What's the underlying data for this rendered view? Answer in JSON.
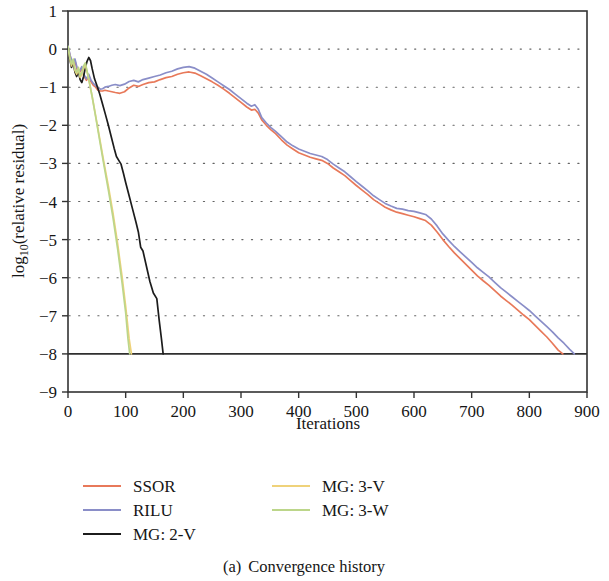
{
  "figure": {
    "caption_prefix": "(a)",
    "caption_text": "Convergence history"
  },
  "chart_data": {
    "type": "line",
    "title": "",
    "subtitle": "",
    "xlabel": "Iterations",
    "ylabel": "log10(relative residual)",
    "ylabel_base": "log",
    "ylabel_sub": "10",
    "ylabel_rest": "(relative residual)",
    "xlim": [
      0,
      900
    ],
    "ylim": [
      -9,
      1
    ],
    "xticks": [
      0,
      100,
      200,
      300,
      400,
      500,
      600,
      700,
      800,
      900
    ],
    "yticks": [
      1,
      0,
      -1,
      -2,
      -3,
      -4,
      -5,
      -6,
      -7,
      -8,
      -9
    ],
    "xticklabels": [
      "0",
      "100",
      "200",
      "300",
      "400",
      "500",
      "600",
      "700",
      "800",
      "900"
    ],
    "yticklabels": [
      "1",
      "0",
      "−1",
      "−2",
      "−3",
      "−4",
      "−5",
      "−6",
      "−7",
      "−8",
      "−9"
    ],
    "grid": "horizontal-dotted",
    "legend_position": "below-axes-two-columns",
    "tolerance": -8,
    "annotations": [],
    "series": [
      {
        "name": "SSOR",
        "color": "#e8795a",
        "x": [
          0,
          4,
          8,
          12,
          16,
          20,
          24,
          28,
          32,
          36,
          40,
          44,
          48,
          52,
          56,
          60,
          64,
          70,
          76,
          82,
          90,
          98,
          106,
          114,
          122,
          130,
          140,
          150,
          160,
          170,
          180,
          190,
          200,
          210,
          220,
          230,
          240,
          250,
          260,
          270,
          280,
          290,
          300,
          310,
          318,
          324,
          330,
          336,
          344,
          352,
          360,
          370,
          380,
          390,
          400,
          410,
          420,
          430,
          440,
          450,
          460,
          470,
          480,
          490,
          500,
          510,
          520,
          530,
          540,
          550,
          560,
          570,
          580,
          590,
          600,
          610,
          620,
          630,
          640,
          650,
          660,
          670,
          680,
          690,
          700,
          710,
          720,
          730,
          740,
          750,
          760,
          770,
          780,
          790,
          800,
          810,
          820,
          830,
          840,
          850,
          858
        ],
        "y": [
          0.05,
          -0.2,
          -0.42,
          -0.3,
          -0.55,
          -0.62,
          -0.5,
          -0.72,
          -0.82,
          -0.7,
          -0.86,
          -0.95,
          -1.0,
          -1.08,
          -1.1,
          -1.1,
          -1.08,
          -1.1,
          -1.12,
          -1.14,
          -1.16,
          -1.12,
          -1.02,
          -0.95,
          -0.98,
          -0.93,
          -0.88,
          -0.86,
          -0.8,
          -0.75,
          -0.72,
          -0.66,
          -0.62,
          -0.6,
          -0.63,
          -0.7,
          -0.78,
          -0.86,
          -0.95,
          -1.05,
          -1.16,
          -1.28,
          -1.4,
          -1.52,
          -1.6,
          -1.58,
          -1.68,
          -1.86,
          -2.0,
          -2.12,
          -2.22,
          -2.38,
          -2.52,
          -2.62,
          -2.72,
          -2.78,
          -2.84,
          -2.88,
          -2.92,
          -3.0,
          -3.12,
          -3.22,
          -3.32,
          -3.45,
          -3.58,
          -3.7,
          -3.82,
          -3.95,
          -4.05,
          -4.15,
          -4.22,
          -4.28,
          -4.32,
          -4.36,
          -4.4,
          -4.45,
          -4.5,
          -4.62,
          -4.8,
          -5.0,
          -5.18,
          -5.35,
          -5.5,
          -5.65,
          -5.8,
          -5.95,
          -6.08,
          -6.2,
          -6.34,
          -6.48,
          -6.6,
          -6.72,
          -6.85,
          -6.98,
          -7.1,
          -7.25,
          -7.4,
          -7.55,
          -7.72,
          -7.9,
          -8.0
        ]
      },
      {
        "name": "RILU",
        "color": "#8a8ec8",
        "x": [
          0,
          4,
          8,
          12,
          16,
          20,
          24,
          28,
          32,
          36,
          40,
          44,
          48,
          52,
          56,
          60,
          64,
          70,
          76,
          82,
          90,
          98,
          106,
          114,
          122,
          130,
          140,
          150,
          160,
          170,
          180,
          190,
          200,
          210,
          220,
          230,
          240,
          250,
          260,
          270,
          280,
          290,
          300,
          310,
          318,
          324,
          330,
          336,
          344,
          352,
          360,
          370,
          380,
          390,
          400,
          410,
          420,
          430,
          440,
          450,
          460,
          470,
          480,
          490,
          500,
          510,
          520,
          530,
          540,
          550,
          560,
          570,
          580,
          590,
          600,
          610,
          620,
          630,
          640,
          650,
          660,
          670,
          680,
          690,
          700,
          710,
          720,
          730,
          740,
          750,
          760,
          770,
          780,
          790,
          800,
          810,
          820,
          830,
          840,
          850,
          860,
          870,
          878
        ],
        "y": [
          0.08,
          -0.18,
          -0.38,
          -0.26,
          -0.5,
          -0.58,
          -0.46,
          -0.68,
          -0.78,
          -0.66,
          -0.82,
          -0.9,
          -0.96,
          -1.02,
          -1.05,
          -1.04,
          -1.0,
          -0.98,
          -0.95,
          -0.93,
          -0.96,
          -0.92,
          -0.85,
          -0.82,
          -0.86,
          -0.8,
          -0.76,
          -0.72,
          -0.68,
          -0.62,
          -0.58,
          -0.52,
          -0.48,
          -0.46,
          -0.5,
          -0.58,
          -0.66,
          -0.76,
          -0.86,
          -0.96,
          -1.06,
          -1.18,
          -1.3,
          -1.42,
          -1.5,
          -1.46,
          -1.58,
          -1.8,
          -1.94,
          -2.06,
          -2.16,
          -2.3,
          -2.44,
          -2.54,
          -2.62,
          -2.68,
          -2.74,
          -2.78,
          -2.82,
          -2.9,
          -3.02,
          -3.12,
          -3.22,
          -3.35,
          -3.48,
          -3.6,
          -3.72,
          -3.85,
          -3.95,
          -4.05,
          -4.12,
          -4.18,
          -4.2,
          -4.24,
          -4.26,
          -4.3,
          -4.34,
          -4.46,
          -4.64,
          -4.85,
          -5.02,
          -5.18,
          -5.32,
          -5.46,
          -5.6,
          -5.74,
          -5.86,
          -5.98,
          -6.12,
          -6.26,
          -6.38,
          -6.5,
          -6.62,
          -6.74,
          -6.86,
          -7.0,
          -7.14,
          -7.28,
          -7.42,
          -7.58,
          -7.72,
          -7.88,
          -8.0
        ]
      },
      {
        "name": "MG: 2-V",
        "color": "#1c1c1c",
        "x": [
          0,
          3,
          6,
          9,
          12,
          15,
          18,
          21,
          24,
          27,
          30,
          33,
          36,
          39,
          42,
          46,
          50,
          55,
          60,
          65,
          70,
          75,
          80,
          84,
          88,
          92,
          96,
          100,
          106,
          112,
          118,
          122,
          126,
          130,
          136,
          142,
          148,
          154,
          158,
          162,
          165
        ],
        "y": [
          0.05,
          -0.25,
          -0.48,
          -0.35,
          -0.6,
          -0.72,
          -0.58,
          -0.8,
          -0.88,
          -0.72,
          -0.5,
          -0.32,
          -0.22,
          -0.3,
          -0.52,
          -0.78,
          -0.95,
          -1.18,
          -1.45,
          -1.72,
          -2.0,
          -2.3,
          -2.6,
          -2.82,
          -2.92,
          -3.02,
          -3.25,
          -3.5,
          -3.85,
          -4.2,
          -4.55,
          -4.8,
          -5.2,
          -5.3,
          -5.7,
          -6.1,
          -6.4,
          -6.55,
          -7.1,
          -7.6,
          -8.0
        ]
      },
      {
        "name": "MG: 3-V",
        "color": "#efd27a",
        "x": [
          0,
          3,
          6,
          9,
          12,
          15,
          18,
          21,
          24,
          27,
          30,
          34,
          38,
          42,
          48,
          55,
          62,
          70,
          78,
          86,
          94,
          100,
          106,
          110
        ],
        "y": [
          0.06,
          -0.22,
          -0.44,
          -0.3,
          -0.56,
          -0.66,
          -0.52,
          -0.74,
          -0.68,
          -0.5,
          -0.4,
          -0.66,
          -0.95,
          -1.25,
          -1.75,
          -2.35,
          -2.95,
          -3.6,
          -4.3,
          -5.1,
          -6.0,
          -6.75,
          -7.6,
          -8.0
        ]
      },
      {
        "name": "MG: 3-W",
        "color": "#bcd68a",
        "x": [
          0,
          3,
          6,
          9,
          12,
          15,
          18,
          21,
          24,
          27,
          30,
          34,
          38,
          42,
          48,
          55,
          62,
          70,
          78,
          86,
          94,
          100,
          104,
          107
        ],
        "y": [
          0.07,
          -0.2,
          -0.4,
          -0.26,
          -0.52,
          -0.62,
          -0.48,
          -0.7,
          -0.62,
          -0.44,
          -0.36,
          -0.64,
          -0.94,
          -1.26,
          -1.78,
          -2.4,
          -3.02,
          -3.7,
          -4.42,
          -5.24,
          -6.16,
          -6.92,
          -7.6,
          -8.0
        ]
      }
    ]
  },
  "legend": {
    "column_one": [
      {
        "label": "SSOR",
        "color": "#e8795a"
      },
      {
        "label": "RILU",
        "color": "#8a8ec8"
      },
      {
        "label": "MG: 2-V",
        "color": "#1c1c1c"
      }
    ],
    "column_two": [
      {
        "label": "MG: 3-V",
        "color": "#efd27a"
      },
      {
        "label": "MG: 3-W",
        "color": "#bcd68a"
      }
    ]
  }
}
